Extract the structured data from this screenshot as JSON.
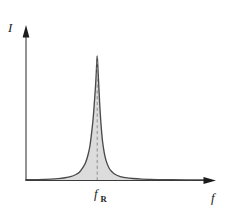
{
  "chart_data": {
    "type": "line",
    "title": "",
    "subtitle": "",
    "xlabel": "f",
    "ylabel": "I",
    "grid": false,
    "legend": null,
    "axis_style": "arrow-terminated half-axes",
    "xlim": [
      0,
      1
    ],
    "ylim": [
      0,
      1.05
    ],
    "x_tick_labels": [
      "f_R"
    ],
    "x_tick_values": [
      0.4
    ],
    "y_tick_labels": [],
    "annotations": [
      {
        "name": "resonance-center-dashed-line",
        "type": "vertical-dashed-line",
        "x": 0.4,
        "from_y": 0,
        "to_y": 1.0
      }
    ],
    "series": [
      {
        "name": "resonance-intensity",
        "curve_model": "lorentzian",
        "peak_x": 0.4,
        "peak_y": 1.0,
        "half_width_half_max": 0.028,
        "fill": "#dcdcdc",
        "stroke": "#4a4a4a",
        "x": [
          0.0,
          0.05,
          0.1,
          0.14,
          0.18,
          0.22,
          0.25,
          0.28,
          0.3,
          0.32,
          0.335,
          0.35,
          0.36,
          0.37,
          0.378,
          0.385,
          0.39,
          0.394,
          0.397,
          0.4,
          0.403,
          0.406,
          0.41,
          0.415,
          0.422,
          0.43,
          0.44,
          0.45,
          0.465,
          0.48,
          0.5,
          0.53,
          0.56,
          0.6,
          0.65,
          0.7,
          0.76,
          0.82,
          1.0
        ],
        "y": [
          0.006,
          0.007,
          0.009,
          0.011,
          0.015,
          0.022,
          0.031,
          0.048,
          0.067,
          0.105,
          0.145,
          0.215,
          0.285,
          0.4,
          0.51,
          0.645,
          0.745,
          0.845,
          0.935,
          1.0,
          0.935,
          0.845,
          0.73,
          0.59,
          0.44,
          0.315,
          0.22,
          0.16,
          0.105,
          0.074,
          0.05,
          0.032,
          0.023,
          0.016,
          0.011,
          0.009,
          0.007,
          0.006,
          0.005
        ]
      }
    ]
  },
  "labels": {
    "y_axis": "I",
    "x_axis": "f",
    "resonance_tick_base": "f",
    "resonance_tick_subscript": "R"
  },
  "colors": {
    "background": "#ffffff",
    "axis": "#3a3a3a",
    "curve_stroke": "#4a4a4a",
    "curve_fill": "#dcdcdc",
    "dashed_line": "#8d8d8d",
    "text": "#1c1c1c"
  }
}
